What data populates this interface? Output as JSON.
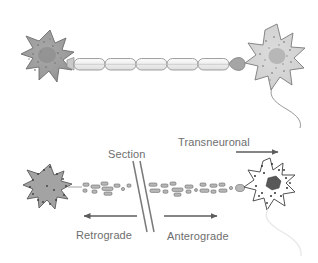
{
  "figure": {
    "background_color": "#ffffff",
    "width": 318,
    "height": 263
  },
  "labels": {
    "transneuronal": "Transneuronal",
    "section": "Section",
    "retrograde": "Retrograde",
    "anterograde": "Anterograde"
  },
  "colors": {
    "text": "#6e6e6e",
    "arrow": "#5c5c5c",
    "soma_dark_fill": "#9e9e9e",
    "soma_dark_stroke": "#6e6e6e",
    "soma_light_fill": "#cfcfcf",
    "soma_light_stroke": "#7a7a7a",
    "soma_white_fill": "#ffffff",
    "soma_white_stroke": "#4a4a4a",
    "axon_stroke": "#8a8a8a",
    "myelin_fill": "#f2f2f2",
    "granule_fill": "#b5b5b5",
    "granule_stroke": "#6b6b6b",
    "faint_axon": "#e3e3e3",
    "section_line": "#7a7a7a"
  },
  "panels": {
    "top": {
      "name": "intact-neuron-pair",
      "left_neuron": {
        "name": "presynaptic-soma",
        "shade": "dark"
      },
      "axon": {
        "name": "myelinated-axon",
        "segment_count": 5
      },
      "terminal": {
        "name": "axon-terminal-bouton"
      },
      "right_neuron": {
        "name": "postsynaptic-soma",
        "shade": "light"
      }
    },
    "bottom": {
      "name": "tracer-transport-panel",
      "left_neuron": {
        "name": "retrograde-labelled-soma",
        "shade": "dark"
      },
      "right_neuron": {
        "name": "transneuronal-labelled-soma",
        "shade": "white"
      },
      "tracer": {
        "name": "tracer-granules",
        "granule_count": 34
      },
      "section_marks": {
        "name": "section-cut-lines",
        "line_count": 2
      }
    }
  },
  "arrows": {
    "transneuronal": {
      "direction": "right",
      "name": "transneuronal-arrow"
    },
    "retrograde": {
      "direction": "left",
      "name": "retrograde-arrow"
    },
    "anterograde": {
      "direction": "right",
      "name": "anterograde-arrow"
    }
  }
}
